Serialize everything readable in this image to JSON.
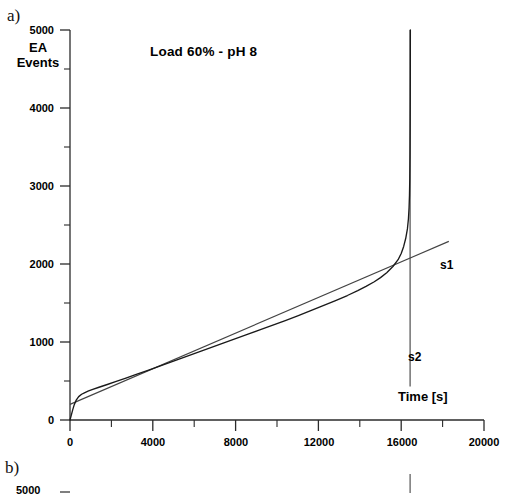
{
  "figure": {
    "panel_a_letter": "a)",
    "panel_b_letter": "b)"
  },
  "chart_data": {
    "type": "line",
    "title": "Load 60% - pH 8",
    "xlabel": "Time [s]",
    "ylabel": "EA\nEvents",
    "ylabel_line1": "EA",
    "ylabel_line2": "Events",
    "xlim": [
      0,
      20000
    ],
    "ylim": [
      0,
      5000
    ],
    "xticks": [
      0,
      4000,
      8000,
      12000,
      16000,
      20000
    ],
    "xtick_labels": [
      "0",
      "4000",
      "8000",
      "12000",
      "16000",
      "20000"
    ],
    "xminor_step": 2000,
    "yticks": [
      0,
      1000,
      2000,
      3000,
      4000,
      5000
    ],
    "ytick_labels": [
      "0",
      "1000",
      "2000",
      "3000",
      "4000",
      "5000"
    ],
    "yminor_step": 500,
    "grid": false,
    "legend": "none",
    "series": [
      {
        "name": "EA events curve",
        "type": "line",
        "points": [
          [
            0,
            0
          ],
          [
            60,
            60
          ],
          [
            130,
            130
          ],
          [
            210,
            200
          ],
          [
            300,
            255
          ],
          [
            420,
            300
          ],
          [
            560,
            330
          ],
          [
            720,
            352
          ],
          [
            900,
            372
          ],
          [
            1100,
            392
          ],
          [
            1400,
            420
          ],
          [
            1800,
            455
          ],
          [
            2200,
            492
          ],
          [
            2700,
            538
          ],
          [
            3200,
            585
          ],
          [
            3800,
            640
          ],
          [
            4400,
            697
          ],
          [
            5000,
            755
          ],
          [
            5600,
            812
          ],
          [
            6200,
            870
          ],
          [
            6800,
            928
          ],
          [
            7400,
            985
          ],
          [
            8000,
            1043
          ],
          [
            8600,
            1100
          ],
          [
            9200,
            1158
          ],
          [
            9800,
            1216
          ],
          [
            10400,
            1275
          ],
          [
            11000,
            1335
          ],
          [
            11600,
            1398
          ],
          [
            12200,
            1462
          ],
          [
            12800,
            1528
          ],
          [
            13400,
            1596
          ],
          [
            13900,
            1658
          ],
          [
            14300,
            1712
          ],
          [
            14700,
            1772
          ],
          [
            15000,
            1825
          ],
          [
            15300,
            1888
          ],
          [
            15600,
            1968
          ],
          [
            15850,
            2055
          ],
          [
            16000,
            2135
          ],
          [
            16120,
            2225
          ],
          [
            16220,
            2330
          ],
          [
            16300,
            2450
          ],
          [
            16350,
            2580
          ],
          [
            16380,
            2720
          ],
          [
            16400,
            2880
          ],
          [
            16415,
            3100
          ],
          [
            16425,
            3400
          ],
          [
            16432,
            3750
          ],
          [
            16437,
            4150
          ],
          [
            16440,
            4550
          ],
          [
            16442,
            5000
          ]
        ]
      },
      {
        "name": "s1",
        "type": "tangent-line",
        "label": "s1",
        "x0": 0,
        "y0": 200,
        "x1": 18300,
        "y1": 2290
      },
      {
        "name": "s2",
        "type": "vertical-asymptote",
        "label": "s2",
        "x": 16430,
        "y_top": 5000,
        "y_bottom": 430
      }
    ]
  },
  "panel_b": {
    "xtick_labels": [
      "0",
      "4000",
      "8000",
      "12000",
      "16000",
      "20000"
    ],
    "ytick_label_partial": "5000"
  }
}
